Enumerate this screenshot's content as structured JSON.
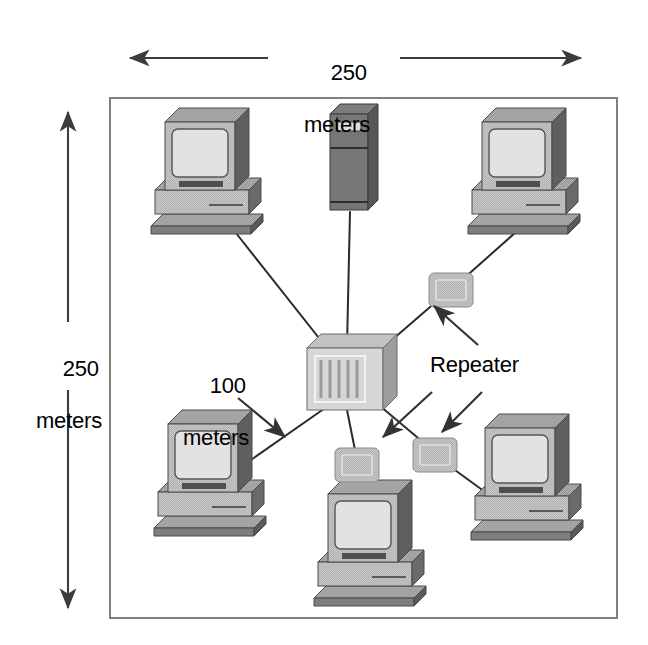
{
  "diagram": {
    "frame": {
      "name": "site-boundary"
    },
    "labels": {
      "top_dimension": {
        "value": "250",
        "unit": "meters"
      },
      "left_dimension": {
        "value": "250",
        "unit": "meters"
      },
      "segment_length": {
        "value": "100",
        "unit": "meters"
      },
      "repeater_callout": "Repeater"
    },
    "colors": {
      "frame_stroke": "#808080",
      "link_stroke": "#2b2b2b",
      "arrow_stroke": "#3c3c3c",
      "device_light": "#b9b9b9",
      "device_mid": "#a0a0a0",
      "device_dark": "#6e6e6e",
      "server_body": "#6b6b6b",
      "screen": "#dcdcdc",
      "hub_face": "#d2d2d2",
      "repeater_face": "#b5b5b5",
      "text": "#000000"
    },
    "nodes": [
      {
        "id": "server-top",
        "type": "server",
        "label": "",
        "x": 350,
        "y": 162
      },
      {
        "id": "workstation-tl",
        "type": "workstation",
        "label": "",
        "x": 205,
        "y": 196
      },
      {
        "id": "workstation-tr",
        "type": "workstation",
        "label": "",
        "x": 522,
        "y": 196
      },
      {
        "id": "workstation-bl",
        "type": "workstation",
        "label": "",
        "x": 208,
        "y": 498
      },
      {
        "id": "workstation-br",
        "type": "workstation",
        "label": "",
        "x": 525,
        "y": 502
      },
      {
        "id": "workstation-bc",
        "type": "workstation",
        "label": "",
        "x": 368,
        "y": 568
      },
      {
        "id": "hub-center",
        "type": "hub",
        "label": "",
        "x": 345,
        "y": 378
      },
      {
        "id": "repeater-upper",
        "type": "repeater",
        "label": "Repeater",
        "x": 451,
        "y": 290
      },
      {
        "id": "repeater-lower",
        "type": "repeater",
        "label": "Repeater",
        "x": 435,
        "y": 455
      },
      {
        "id": "repeater-center",
        "type": "repeater",
        "label": "Repeater",
        "x": 357,
        "y": 465
      }
    ],
    "links": [
      {
        "from": "hub-center",
        "to": "workstation-tl"
      },
      {
        "from": "hub-center",
        "to": "server-top"
      },
      {
        "from": "hub-center",
        "to": "repeater-upper"
      },
      {
        "from": "repeater-upper",
        "to": "workstation-tr"
      },
      {
        "from": "hub-center",
        "to": "workstation-bl"
      },
      {
        "from": "hub-center",
        "to": "repeater-center"
      },
      {
        "from": "repeater-center",
        "to": "workstation-bc"
      },
      {
        "from": "hub-center",
        "to": "repeater-lower"
      },
      {
        "from": "repeater-lower",
        "to": "workstation-br"
      }
    ],
    "callout_arrows": [
      {
        "name": "segment-length-arrow",
        "points_to": "hub-to-workstation-bl-link"
      },
      {
        "name": "repeater-arrow-upper",
        "points_to": "repeater-upper"
      },
      {
        "name": "repeater-arrow-center",
        "points_to": "repeater-center"
      }
    ]
  }
}
